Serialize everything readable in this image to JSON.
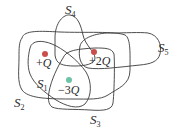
{
  "diagram": {
    "type": "gaussian-surfaces",
    "surfaces": [
      {
        "id": "S1",
        "label": "S",
        "subscript": "1"
      },
      {
        "id": "S2",
        "label": "S",
        "subscript": "2"
      },
      {
        "id": "S3",
        "label": "S",
        "subscript": "3"
      },
      {
        "id": "S4",
        "label": "S",
        "subscript": "4"
      },
      {
        "id": "S5",
        "label": "S",
        "subscript": "5"
      }
    ],
    "charges": [
      {
        "id": "q1",
        "sign": "+",
        "magnitude": "",
        "symbol": "Q",
        "color": "#c9504a"
      },
      {
        "id": "q2",
        "sign": "+",
        "magnitude": "2",
        "symbol": "Q",
        "color": "#c9504a"
      },
      {
        "id": "q3",
        "sign": "−",
        "magnitude": "3",
        "symbol": "Q",
        "color": "#6cc3a8"
      }
    ],
    "colors": {
      "outline": "#3a3a3a",
      "positive_charge": "#c9504a",
      "negative_charge": "#6cc3a8",
      "background": "#ffffff"
    }
  }
}
